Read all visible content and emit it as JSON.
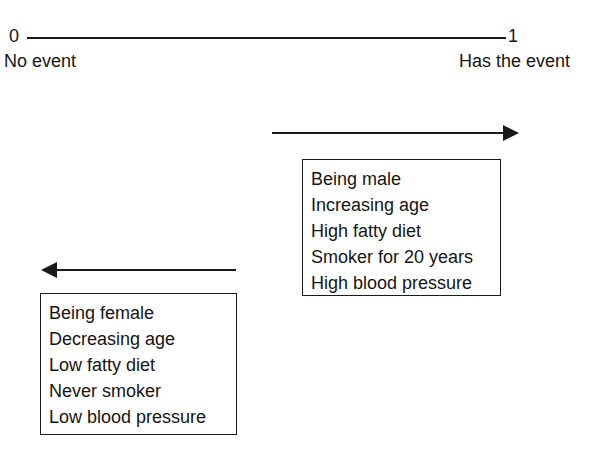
{
  "scale": {
    "min_label": "0",
    "max_label": "1",
    "min_caption": "No event",
    "max_caption": "Has the event",
    "line_color": "#1a1a1a"
  },
  "arrows": {
    "increase": {
      "name": "arrow-pointing-right",
      "direction": "right",
      "color": "#1a1a1a"
    },
    "decrease": {
      "name": "arrow-pointing-left",
      "direction": "left",
      "color": "#1a1a1a"
    }
  },
  "boxes": {
    "increase_risk": {
      "items": [
        "Being male",
        "Increasing age",
        "High fatty diet",
        "Smoker for 20 years",
        "High blood pressure"
      ]
    },
    "decrease_risk": {
      "items": [
        "Being female",
        "Decreasing age",
        "Low fatty diet",
        "Never smoker",
        "Low blood pressure"
      ]
    }
  },
  "colors": {
    "background": "#ffffff",
    "ink": "#151515"
  }
}
